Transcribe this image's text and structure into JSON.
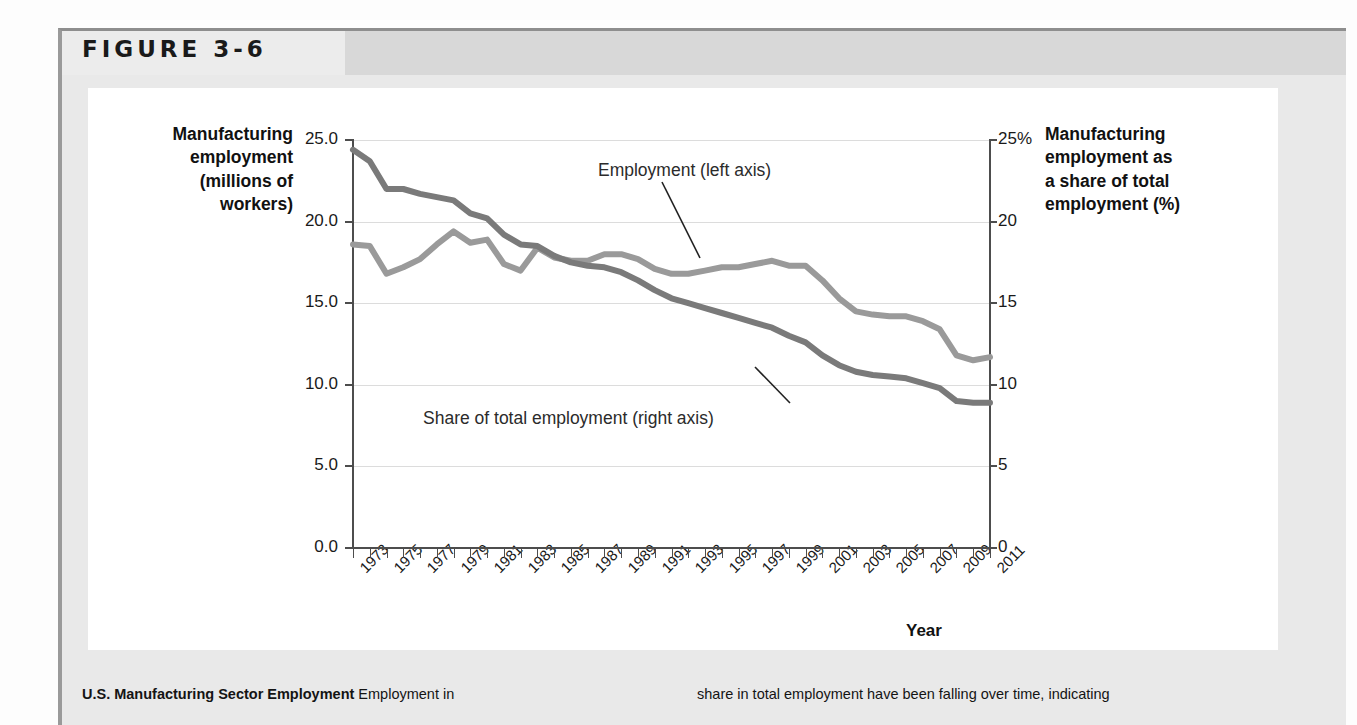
{
  "figure": {
    "number_label": "FIGURE 3-6"
  },
  "caption": {
    "title": "U.S. Manufacturing Sector Employment",
    "left_text": "Employment in",
    "right_text": "share in total employment have been falling over time, indicating"
  },
  "axes": {
    "left_title": "Manufacturing employment (millions of workers)",
    "left_title_lines": [
      "Manufacturing",
      "employment",
      "(millions of",
      "workers)"
    ],
    "right_title": "Manufacturing employment as a share of total employment (%)",
    "right_title_lines": [
      "Manufacturing",
      "employment as",
      "a share of total",
      "employment (%)"
    ],
    "x_title": "Year",
    "left_ticks": [
      "25.0",
      "20.0",
      "15.0",
      "10.0",
      "5.0",
      "0.0"
    ],
    "right_ticks": [
      "25%",
      "20",
      "15",
      "10",
      "5",
      "0"
    ]
  },
  "annotations": {
    "employment": "Employment (left axis)",
    "share": "Share of total employment (right axis)"
  },
  "colors": {
    "employment_line": "#9a9a9a",
    "share_line": "#7a7a7a",
    "axis": "#4d4d4d",
    "gridline": "#dcdcdc",
    "frame": "#e9e9e9",
    "header_band": "#d8d8d8"
  },
  "chart_data": {
    "type": "line",
    "title": "U.S. Manufacturing Sector Employment",
    "xlabel": "Year",
    "ylabel": "Manufacturing employment (millions of workers)",
    "y2label": "Manufacturing employment as a share of total employment (%)",
    "ylim": [
      0,
      25
    ],
    "y2lim": [
      0,
      25
    ],
    "grid": true,
    "legend": "inline-annotations",
    "x": [
      1973,
      1974,
      1975,
      1976,
      1977,
      1978,
      1979,
      1980,
      1981,
      1982,
      1983,
      1984,
      1985,
      1986,
      1987,
      1988,
      1989,
      1990,
      1991,
      1992,
      1993,
      1994,
      1995,
      1996,
      1997,
      1998,
      1999,
      2000,
      2001,
      2002,
      2003,
      2004,
      2005,
      2006,
      2007,
      2008,
      2009,
      2010,
      2011
    ],
    "x_tick_labels": [
      "1973",
      "1975",
      "1977",
      "1979",
      "1981",
      "1983",
      "1985",
      "1987",
      "1989",
      "1991",
      "1993",
      "1995",
      "1997",
      "1999",
      "2001",
      "2003",
      "2005",
      "2007",
      "2009",
      "2011"
    ],
    "series": [
      {
        "name": "Employment (left axis)",
        "axis": "left",
        "units": "millions of workers",
        "color": "#9a9a9a",
        "values": [
          18.6,
          18.5,
          16.8,
          17.2,
          17.7,
          18.6,
          19.4,
          18.7,
          18.9,
          17.4,
          17.0,
          18.4,
          17.8,
          17.6,
          17.6,
          18.0,
          18.0,
          17.7,
          17.1,
          16.8,
          16.8,
          17.0,
          17.2,
          17.2,
          17.4,
          17.6,
          17.3,
          17.3,
          16.4,
          15.3,
          14.5,
          14.3,
          14.2,
          14.2,
          13.9,
          13.4,
          11.8,
          11.5,
          11.7
        ]
      },
      {
        "name": "Share of total employment (right axis)",
        "axis": "right",
        "units": "%",
        "color": "#7a7a7a",
        "values": [
          24.4,
          23.7,
          22.0,
          22.0,
          21.7,
          21.5,
          21.3,
          20.5,
          20.2,
          19.2,
          18.6,
          18.5,
          17.9,
          17.5,
          17.3,
          17.2,
          16.9,
          16.4,
          15.8,
          15.3,
          15.0,
          14.7,
          14.4,
          14.1,
          13.8,
          13.5,
          13.0,
          12.6,
          11.8,
          11.2,
          10.8,
          10.6,
          10.5,
          10.4,
          10.1,
          9.8,
          9.0,
          8.9,
          8.9
        ]
      }
    ]
  }
}
